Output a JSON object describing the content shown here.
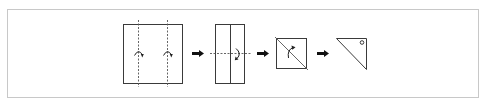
{
  "diagram": {
    "type": "origami-folding-steps",
    "colors": {
      "frame_border": "#c8c8c8",
      "line": "#3a3a3a",
      "arrow": "#111111",
      "background": "#ffffff"
    },
    "steps": [
      {
        "id": 1,
        "shape": "square",
        "description": "Square with two vertical valley-fold dashed lines and two fold arcs",
        "icon": "fold-arc-icon"
      },
      {
        "id": 2,
        "shape": "rectangle",
        "description": "Tall rectangle with center crease, horizontal dashed fold line and fold arc",
        "icon": "fold-arc-icon"
      },
      {
        "id": 3,
        "shape": "square",
        "description": "Small square with diagonal fold line and fold arc",
        "icon": "fold-arc-icon"
      },
      {
        "id": 4,
        "shape": "triangle",
        "description": "Right triangle with small circle marker in corner",
        "icon": "circle-marker-icon"
      }
    ],
    "transitions": [
      {
        "from": 1,
        "to": 2,
        "icon": "right-arrow-icon"
      },
      {
        "from": 2,
        "to": 3,
        "icon": "right-arrow-icon"
      },
      {
        "from": 3,
        "to": 4,
        "icon": "right-arrow-icon"
      }
    ]
  }
}
